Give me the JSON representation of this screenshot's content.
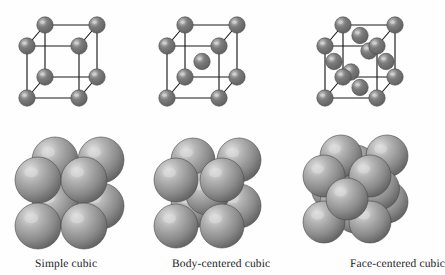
{
  "figure": {
    "background_color": "#fefefe",
    "edge_color": "#1a1a1a",
    "small_sphere_color": "#7c7c7c",
    "small_sphere_highlight": "#c9c9c9",
    "large_sphere_color": "#8a8a8a",
    "large_sphere_highlight": "#e2e2e2",
    "large_sphere_rim": "#4f4f4f"
  },
  "cells": [
    {
      "id": "simple-cubic",
      "caption": "Simple cubic",
      "caption_x": 35,
      "caption_y": 258,
      "lattice_type": "simple cubic",
      "corner_atoms": 8,
      "body_center_atoms": 0,
      "face_center_atoms": 0,
      "total_spheres_shown": 8,
      "wire": {
        "x": 12,
        "y": 10,
        "w": 120,
        "h": 115,
        "front": {
          "x": 15,
          "y": 36,
          "size": 52
        },
        "offset": {
          "dx": 18,
          "dy": -21
        },
        "sphere_r": 8.2
      },
      "pack": {
        "x": 20,
        "y": 140,
        "w": 120,
        "h": 105,
        "front": {
          "x": 18,
          "y": 40,
          "size": 46
        },
        "offset": {
          "dx": 17,
          "dy": -20
        },
        "sphere_r": 23
      }
    },
    {
      "id": "body-centered-cubic",
      "caption": "Body-centered cubic",
      "caption_x": 172,
      "caption_y": 258,
      "lattice_type": "body-centered cubic",
      "corner_atoms": 8,
      "body_center_atoms": 1,
      "face_center_atoms": 0,
      "total_spheres_shown": 9,
      "wire": {
        "x": 152,
        "y": 10,
        "w": 120,
        "h": 115,
        "front": {
          "x": 15,
          "y": 36,
          "size": 52
        },
        "offset": {
          "dx": 18,
          "dy": -21
        },
        "sphere_r": 8.2
      },
      "pack": {
        "x": 158,
        "y": 140,
        "w": 125,
        "h": 105,
        "front": {
          "x": 18,
          "y": 40,
          "size": 46
        },
        "offset": {
          "dx": 17,
          "dy": -20
        },
        "sphere_r": 22
      }
    },
    {
      "id": "face-centered-cubic",
      "caption": "Face-centered cubic",
      "caption_x": 350,
      "caption_y": 258,
      "lattice_type": "face-centered cubic",
      "corner_atoms": 8,
      "body_center_atoms": 0,
      "face_center_atoms": 6,
      "total_spheres_shown": 14,
      "clipped_at_right_edge": true,
      "wire": {
        "x": 310,
        "y": 10,
        "w": 128,
        "h": 115,
        "front": {
          "x": 15,
          "y": 36,
          "size": 52
        },
        "offset": {
          "dx": 18,
          "dy": -21
        },
        "sphere_r": 8.2
      },
      "pack": {
        "x": 306,
        "y": 136,
        "w": 132,
        "h": 110,
        "front": {
          "x": 18,
          "y": 40,
          "size": 46
        },
        "offset": {
          "dx": 17,
          "dy": -20
        },
        "sphere_r": 21
      }
    }
  ]
}
